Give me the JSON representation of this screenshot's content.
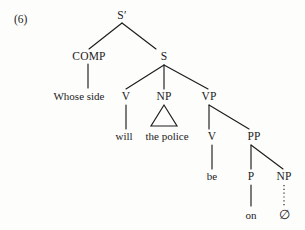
{
  "figure": {
    "example_number": "(6)",
    "background_color": "#fdfdfc",
    "ink_color": "#1c1c1c"
  },
  "tree": {
    "type": "constituency-tree",
    "sentence": "Whose side will the police be on ∅",
    "nodes": [
      {
        "id": "sbar",
        "label": "S′",
        "kind": "category",
        "x": 122,
        "y": 19
      },
      {
        "id": "comp",
        "label": "COMP",
        "kind": "category",
        "x": 89,
        "y": 60
      },
      {
        "id": "s",
        "label": "S",
        "kind": "category",
        "x": 164,
        "y": 60
      },
      {
        "id": "whose",
        "label": "Whose side",
        "kind": "word",
        "x": 79,
        "y": 100
      },
      {
        "id": "v1",
        "label": "V",
        "kind": "category",
        "x": 126,
        "y": 100
      },
      {
        "id": "np1",
        "label": "NP",
        "kind": "category",
        "x": 164,
        "y": 100
      },
      {
        "id": "vp",
        "label": "VP",
        "kind": "category",
        "x": 209,
        "y": 100
      },
      {
        "id": "will",
        "label": "will",
        "kind": "word",
        "x": 124,
        "y": 140
      },
      {
        "id": "thepolice",
        "label": "the police",
        "kind": "word",
        "x": 167,
        "y": 140
      },
      {
        "id": "v2",
        "label": "V",
        "kind": "category",
        "x": 212,
        "y": 140
      },
      {
        "id": "pp",
        "label": "PP",
        "kind": "category",
        "x": 254,
        "y": 140
      },
      {
        "id": "be",
        "label": "be",
        "kind": "word",
        "x": 212,
        "y": 180
      },
      {
        "id": "p",
        "label": "P",
        "kind": "category",
        "x": 251,
        "y": 180
      },
      {
        "id": "np2",
        "label": "NP",
        "kind": "category",
        "x": 284,
        "y": 180
      },
      {
        "id": "on",
        "label": "on",
        "kind": "word",
        "x": 251,
        "y": 219
      },
      {
        "id": "empty",
        "label": "∅",
        "kind": "null",
        "x": 284,
        "y": 219
      }
    ],
    "edges": [
      {
        "from": "sbar",
        "to": "comp",
        "style": "solid",
        "x1": 122,
        "y1": 23,
        "x2": 89,
        "y2": 49
      },
      {
        "from": "sbar",
        "to": "s",
        "style": "solid",
        "x1": 122,
        "y1": 23,
        "x2": 156,
        "y2": 49
      },
      {
        "from": "comp",
        "to": "whose",
        "style": "solid",
        "x1": 88,
        "y1": 64,
        "x2": 88,
        "y2": 88
      },
      {
        "from": "s",
        "to": "v1",
        "style": "solid",
        "x1": 164,
        "y1": 65,
        "x2": 126,
        "y2": 89
      },
      {
        "from": "s",
        "to": "np1",
        "style": "solid",
        "x1": 164,
        "y1": 65,
        "x2": 164,
        "y2": 89
      },
      {
        "from": "s",
        "to": "vp",
        "style": "solid",
        "x1": 164,
        "y1": 65,
        "x2": 208,
        "y2": 89
      },
      {
        "from": "v1",
        "to": "will",
        "style": "solid",
        "x1": 126,
        "y1": 105,
        "x2": 126,
        "y2": 129
      },
      {
        "from": "vp",
        "to": "v2",
        "style": "solid",
        "x1": 209,
        "y1": 105,
        "x2": 209,
        "y2": 129
      },
      {
        "from": "vp",
        "to": "pp",
        "style": "solid",
        "x1": 209,
        "y1": 105,
        "x2": 249,
        "y2": 129
      },
      {
        "from": "v2",
        "to": "be",
        "style": "solid",
        "x1": 212,
        "y1": 145,
        "x2": 212,
        "y2": 169
      },
      {
        "from": "pp",
        "to": "p",
        "style": "solid",
        "x1": 251,
        "y1": 145,
        "x2": 251,
        "y2": 169
      },
      {
        "from": "pp",
        "to": "np2",
        "style": "solid",
        "x1": 251,
        "y1": 145,
        "x2": 283,
        "y2": 169
      },
      {
        "from": "p",
        "to": "on",
        "style": "solid",
        "x1": 251,
        "y1": 185,
        "x2": 251,
        "y2": 206
      },
      {
        "from": "np2",
        "to": "empty",
        "style": "dotted",
        "x1": 284,
        "y1": 185,
        "x2": 284,
        "y2": 206
      }
    ],
    "triangles": [
      {
        "id": "np1-triangle",
        "parent": "np1",
        "covers": "the police",
        "apex_x": 164,
        "apex_y": 105,
        "left_x": 151,
        "left_y": 126,
        "right_x": 177,
        "right_y": 126
      }
    ]
  }
}
